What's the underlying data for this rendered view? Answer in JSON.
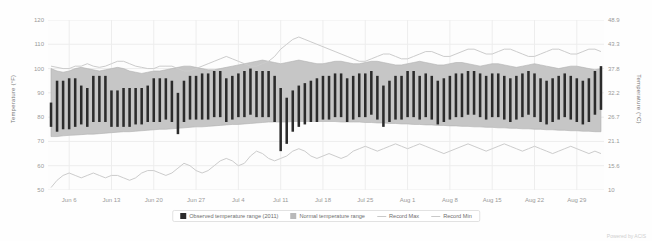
{
  "credit": "Powered by ACIS",
  "legend": {
    "items": [
      {
        "label": "Observed temperature range (2011)",
        "kind": "box",
        "color": "#2b2b2b"
      },
      {
        "label": "Normal temperature range",
        "kind": "box",
        "color": "#b9b9b9"
      },
      {
        "label": "Record Max",
        "kind": "line",
        "color": "#c9c9c9"
      },
      {
        "label": "Record Min",
        "kind": "line",
        "color": "#c9c9c9"
      }
    ]
  },
  "chart_data": {
    "type": "bar",
    "title": "",
    "subtitle": "",
    "xlabel": "",
    "ylabel": "Temperature (°F)",
    "ylabel_right": "Temperature (°C)",
    "grid": true,
    "legend_position": "bottom",
    "ylim": [
      50,
      120
    ],
    "ylim_right": [
      10,
      48.9
    ],
    "yticks": [
      120,
      110,
      100,
      90,
      80,
      70,
      60,
      50
    ],
    "yticks_right": [
      "48.9",
      "43.3",
      "37.8",
      "32.2",
      "26.7",
      "21.1",
      "15.6",
      "10"
    ],
    "xticks": [
      "Jun 6",
      "Jun 13",
      "Jun 20",
      "Jun 27",
      "Jul 4",
      "Jul 11",
      "Jul 18",
      "Jul 25",
      "Aug 1",
      "Aug 8",
      "Aug 15",
      "Aug 22",
      "Aug 29"
    ],
    "xtick_indices": [
      3,
      10,
      17,
      24,
      31,
      38,
      45,
      52,
      59,
      66,
      73,
      80,
      87
    ],
    "n_points": 92,
    "colors": {
      "observed": "#2b2b2b",
      "normal_band": "#c6c6c6",
      "record_band": "#ececec",
      "record_line": "#cccccc",
      "grid": "#ededed"
    },
    "series": [
      {
        "name": "Record Max",
        "type": "line",
        "values": [
          101,
          100.5,
          100,
          100,
          101,
          101,
          102,
          101,
          100.5,
          101,
          102,
          103,
          103,
          102,
          101,
          100.5,
          100,
          100,
          101,
          101,
          101,
          100,
          99,
          99,
          100,
          101,
          102,
          103,
          104,
          105,
          104,
          103,
          102,
          101,
          101,
          102,
          103,
          105,
          108,
          110,
          112,
          113,
          112,
          111,
          110,
          109,
          108,
          107,
          106,
          105,
          104,
          103,
          103,
          104,
          105,
          106,
          106,
          105,
          104,
          104,
          105,
          106,
          107,
          107,
          106,
          105,
          105,
          106,
          107,
          108,
          108,
          107,
          106,
          106,
          107,
          108,
          108,
          107,
          106,
          105,
          105,
          106,
          107,
          108,
          108,
          107,
          106,
          106,
          107,
          108,
          108,
          107
        ]
      },
      {
        "name": "Record Min",
        "type": "line",
        "values": [
          51,
          54,
          56,
          57,
          56,
          55,
          56,
          57,
          56,
          55,
          56,
          56,
          55,
          54,
          55,
          57,
          58,
          58,
          57,
          56,
          57,
          59,
          61,
          60,
          58,
          57,
          58,
          60,
          62,
          63,
          62,
          60,
          61,
          64,
          66,
          65,
          63,
          62,
          63,
          64,
          66,
          67,
          66,
          64,
          63,
          64,
          65,
          64,
          63,
          64,
          66,
          67,
          68,
          67,
          66,
          67,
          68,
          69,
          68,
          67,
          68,
          69,
          68,
          67,
          66,
          65,
          66,
          67,
          68,
          69,
          68,
          67,
          66,
          67,
          68,
          69,
          68,
          67,
          66,
          67,
          68,
          67,
          66,
          65,
          66,
          67,
          68,
          67,
          66,
          65,
          66,
          65
        ]
      },
      {
        "name": "Normal temperature range high",
        "type": "band_high",
        "values": [
          100,
          99,
          98.5,
          99,
          100,
          100.5,
          100,
          99.5,
          99,
          99.5,
          100,
          100.5,
          100,
          99,
          98.5,
          98,
          98.5,
          99,
          99,
          99.5,
          100,
          100.5,
          101,
          101,
          100.5,
          100,
          99.5,
          99.5,
          100,
          100.5,
          101,
          101.5,
          102,
          102.5,
          103,
          103.5,
          103,
          102.5,
          102,
          102.5,
          103,
          103.5,
          103,
          102.5,
          102,
          102,
          102.5,
          103,
          103,
          102.5,
          102,
          102,
          102.5,
          103,
          103,
          102.5,
          102,
          101.5,
          101.5,
          102,
          102.5,
          103,
          102.5,
          102,
          101.5,
          101.5,
          102,
          102.5,
          102.5,
          102,
          101.5,
          101,
          101.5,
          102,
          102,
          101.5,
          101,
          100.5,
          101,
          101.5,
          102,
          101.5,
          101,
          100.5,
          100,
          100.5,
          101,
          101,
          100.5,
          100,
          99.5,
          100
        ]
      },
      {
        "name": "Normal temperature range low",
        "type": "band_low",
        "values": [
          72,
          72,
          72.3,
          72.5,
          72.6,
          72.8,
          73,
          73,
          73.2,
          73.4,
          73.6,
          73.8,
          74,
          74,
          74.2,
          74.4,
          74.6,
          74.8,
          75,
          75,
          75.2,
          75.4,
          75.6,
          75.8,
          76,
          76,
          76.2,
          76.4,
          76.6,
          76.8,
          77,
          77,
          77.2,
          77.4,
          77.6,
          77.8,
          78,
          78,
          78,
          78,
          78.2,
          78.2,
          78.2,
          78.2,
          78.2,
          78.2,
          78.2,
          78.2,
          78,
          78,
          78,
          78,
          77.8,
          77.8,
          77.6,
          77.6,
          77.4,
          77.4,
          77.2,
          77.2,
          77,
          77,
          76.8,
          76.8,
          76.6,
          76.6,
          76.4,
          76.4,
          76.2,
          76.2,
          76,
          76,
          75.8,
          75.8,
          75.6,
          75.6,
          75.4,
          75.4,
          75.2,
          75.2,
          75,
          75,
          74.8,
          74.8,
          74.6,
          74.6,
          74.4,
          74.4,
          74.2,
          74.2,
          74,
          74
        ]
      },
      {
        "name": "Observed temperature range (2011)",
        "type": "bar_range",
        "high": [
          86,
          95,
          95,
          96,
          96,
          93,
          92,
          97,
          97,
          97,
          91,
          91,
          92,
          92,
          92,
          92,
          93,
          96,
          96,
          96,
          95,
          90,
          95,
          97,
          97,
          98,
          98,
          99,
          99,
          96,
          97,
          98,
          99,
          100,
          99,
          99,
          99,
          97,
          92,
          88,
          91,
          93,
          94,
          95,
          96,
          97,
          97,
          98,
          98,
          96,
          97,
          98,
          98,
          99,
          97,
          93,
          95,
          97,
          97,
          99,
          99,
          97,
          98,
          97,
          95,
          96,
          97,
          98,
          98,
          99,
          99,
          98,
          97,
          98,
          98,
          97,
          96,
          97,
          98,
          99,
          98,
          96,
          95,
          96,
          97,
          98,
          97,
          96,
          95,
          96,
          99,
          101
        ],
        "low": [
          76,
          74,
          75,
          75,
          76,
          77,
          76,
          78,
          78,
          78,
          76,
          76,
          76,
          76,
          77,
          77,
          78,
          78,
          78,
          79,
          78,
          73,
          78,
          79,
          79,
          79,
          79,
          80,
          80,
          78,
          79,
          80,
          80,
          81,
          80,
          80,
          80,
          78,
          66,
          69,
          74,
          76,
          77,
          78,
          78,
          79,
          79,
          80,
          80,
          78,
          79,
          80,
          80,
          81,
          79,
          76,
          78,
          79,
          79,
          80,
          80,
          79,
          80,
          79,
          77,
          78,
          79,
          80,
          80,
          81,
          81,
          80,
          79,
          80,
          80,
          79,
          78,
          79,
          80,
          81,
          80,
          78,
          77,
          78,
          79,
          80,
          79,
          78,
          77,
          78,
          81,
          83
        ]
      }
    ]
  }
}
